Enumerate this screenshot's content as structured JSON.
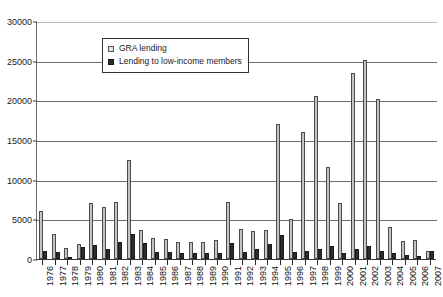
{
  "chart_data": {
    "type": "bar",
    "title": "",
    "subtitle": "",
    "xlabel": "",
    "ylabel": "",
    "ylim": [
      0,
      30000
    ],
    "ytick_labels": [
      "30000",
      "25000",
      "20000",
      "15000",
      "10000",
      "5000",
      "0"
    ],
    "ytick_values": [
      30000,
      25000,
      20000,
      15000,
      10000,
      5000,
      0
    ],
    "grid": true,
    "legend_position": "top-center",
    "categories": [
      "1976",
      "1977",
      "1978",
      "1979",
      "1980",
      "1981",
      "1982",
      "1983",
      "1984",
      "1985",
      "1986",
      "1987",
      "1988",
      "1989",
      "1990",
      "1991",
      "1992",
      "1993",
      "1994",
      "1995",
      "1996",
      "1997",
      "1998",
      "1999",
      "2000",
      "2001",
      "2002",
      "2003",
      "2004",
      "2005",
      "2006",
      "2007"
    ],
    "series": [
      {
        "name": "GRA lending",
        "color": "#c4c4c4",
        "values": [
          6000,
          3200,
          1400,
          1900,
          7000,
          6500,
          7200,
          12500,
          3600,
          2600,
          2500,
          2200,
          2100,
          2100,
          2400,
          7200,
          3800,
          3500,
          3600,
          17000,
          5100,
          16000,
          20500,
          11600,
          7100,
          23500,
          25100,
          20200,
          4000,
          2300,
          2400,
          1000
        ]
      },
      {
        "name": "Lending to low-income members",
        "color": "#2e2e2e",
        "values": [
          1000,
          900,
          300,
          1500,
          1800,
          1200,
          2200,
          3200,
          2000,
          900,
          900,
          800,
          800,
          700,
          800,
          2000,
          900,
          1200,
          1900,
          3000,
          900,
          1000,
          1200,
          1600,
          800,
          1200,
          1600,
          1000,
          700,
          500,
          400,
          1000
        ]
      }
    ]
  },
  "legend": {
    "items": [
      {
        "label": "GRA lending",
        "swatch": "light"
      },
      {
        "label": "Lending to low-income members",
        "swatch": "dark"
      }
    ]
  }
}
